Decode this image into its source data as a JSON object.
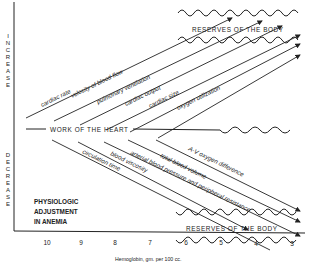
{
  "diagram": {
    "title_note": [
      "PHYSIOLOGIC",
      "ADJUSTMENT",
      "IN ANEMIA"
    ],
    "y_axis_labels": {
      "top": "INCREASE",
      "bottom": "DECREASE"
    },
    "center_line_label": "WORK OF THE HEART",
    "reserves_label_top": "RESERVES OF THE BODY",
    "reserves_label_bottom": "RESERVES OF THE BODY",
    "increase_lines": [
      "cardiac rate",
      "velocity of blood flow",
      "pulmonary ventilation",
      "cardiac output",
      "cardiac size",
      "oxygen utilization"
    ],
    "decrease_lines": [
      "A-V oxygen difference",
      "total blood volume",
      "arterial blood pressure and peripheral resistance",
      "blood viscosity",
      "circulation time"
    ],
    "x_axis": {
      "title": "Hemoglobin, gm. per 100 cc.",
      "ticks": [
        "10",
        "9",
        "8",
        "7",
        "6",
        "5",
        "4",
        "3"
      ]
    },
    "colors": {
      "ink": "#222222",
      "background": "#ffffff"
    }
  }
}
